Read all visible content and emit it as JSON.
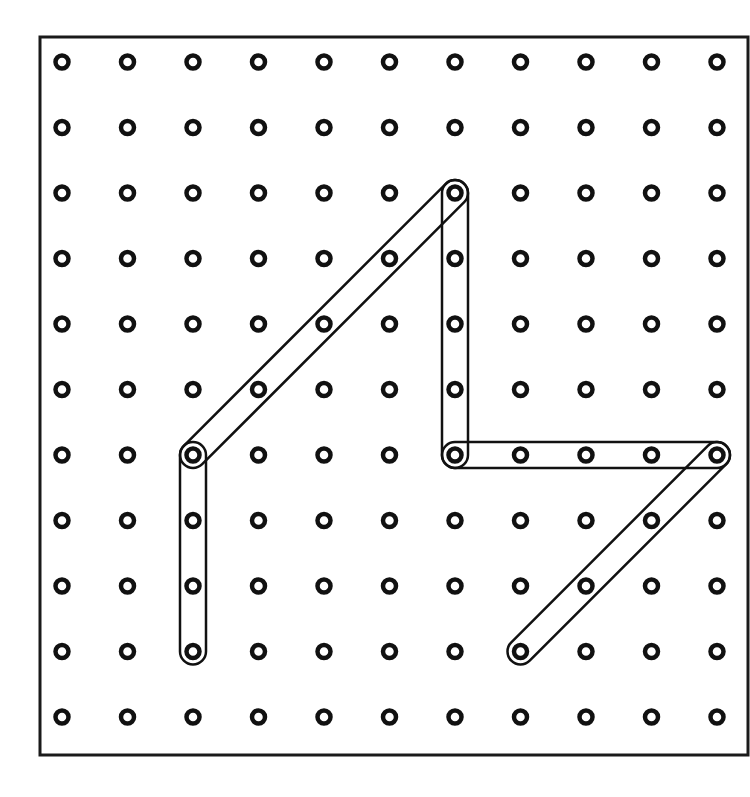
{
  "diagram": {
    "type": "geoboard",
    "title": "",
    "grid": {
      "columns": 11,
      "rows": 11,
      "origin_x": 62,
      "origin_y": 62,
      "spacing": 65.5
    },
    "frame": {
      "x": 40,
      "y": 37,
      "width": 708,
      "height": 718,
      "stroke": "#1a1a1a"
    },
    "peg_color": "#111111",
    "band_color": "#111111",
    "bands": [
      {
        "name": "band-vertical-left",
        "from": [
          2,
          6
        ],
        "to": [
          2,
          9
        ]
      },
      {
        "name": "band-diagonal-left",
        "from": [
          2,
          6
        ],
        "to": [
          6,
          2
        ]
      },
      {
        "name": "band-vertical-center",
        "from": [
          6,
          2
        ],
        "to": [
          6,
          6
        ]
      },
      {
        "name": "band-horizontal-right",
        "from": [
          6,
          6
        ],
        "to": [
          10,
          6
        ]
      },
      {
        "name": "band-diagonal-right",
        "from": [
          10,
          6
        ],
        "to": [
          7,
          9
        ]
      }
    ]
  }
}
